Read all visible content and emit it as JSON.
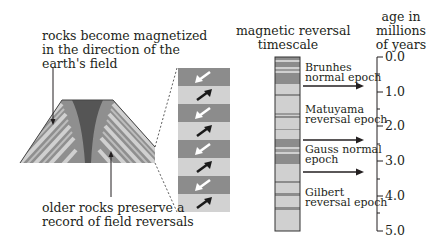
{
  "labels": {
    "top_left_line1": "rocks become magnetized",
    "top_left_line2": "in the direction of the",
    "top_left_line3": "earth's field",
    "bottom_left_line1": "older rocks preserve a",
    "bottom_left_line2": "record of field reversals",
    "timescale_title_line1": "magnetic reversal",
    "timescale_title_line2": "timescale",
    "axis_title_line1": "age in",
    "axis_title_line2": "millions",
    "axis_title_line3": "of years"
  },
  "epochs": [
    {
      "name_line1": "Brunhes",
      "name_line2": "normal epoch"
    },
    {
      "name_line1": "Matuyama",
      "name_line2": "reversal epoch"
    },
    {
      "name_line1": "Gauss normal",
      "name_line2": "epoch"
    },
    {
      "name_line1": "Gilbert",
      "name_line2": "reversal epoch"
    }
  ],
  "axis": {
    "ticks": [
      "0.0",
      "1.0",
      "2.0",
      "3.0",
      "4.0",
      "5.0"
    ],
    "range": [
      0.0,
      5.0
    ]
  },
  "epoch_boundaries_myr": [
    0.78,
    2.58,
    3.58
  ],
  "colors": {
    "dark_band": "#8c8c8c",
    "light_band": "#d2d2d2",
    "magma": "#555555",
    "arrow_normal": "#1a1a1a",
    "arrow_reversed": "#ffffff"
  }
}
